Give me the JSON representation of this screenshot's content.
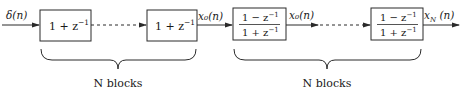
{
  "diagram": {
    "type": "block-diagram",
    "signals": {
      "input": "δ(n)",
      "intermediate_1": "x₀(n)",
      "intermediate_2": "x₀(n)",
      "output": "x",
      "output_sub": "N",
      "output_arg": " (n)"
    },
    "blocks": [
      {
        "id": "block-1",
        "base": "1 + z",
        "exp": "−1"
      },
      {
        "id": "block-2",
        "base": "1 + z",
        "exp": "−1"
      },
      {
        "id": "block-3",
        "num_base": "1 − z",
        "num_exp": "−1",
        "den_base": "1 + z",
        "den_exp": "−1"
      },
      {
        "id": "block-4",
        "num_base": "1 − z",
        "num_exp": "−1",
        "den_base": "1 + z",
        "den_exp": "−1"
      }
    ],
    "groups": [
      {
        "label": "N blocks"
      },
      {
        "label": "N blocks"
      }
    ],
    "colors": {
      "stroke": "#2a2a2a",
      "text": "#1a1a1a",
      "background": "#ffffff"
    }
  }
}
